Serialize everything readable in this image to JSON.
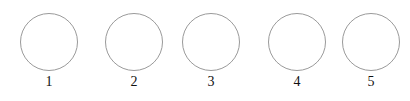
{
  "figure": {
    "background_color": "#ffffff",
    "width": 410,
    "height": 101
  },
  "style": {
    "circle_stroke_color": "#9a9a9a",
    "circle_stroke_width": 1,
    "circle_fill": "none",
    "circle_diameter": 58,
    "label_color": "#111111",
    "label_font_size": 14
  },
  "chart_data": {
    "type": "diagram",
    "title": "",
    "shape": "circle",
    "count": 5,
    "labels": [
      "1",
      "2",
      "3",
      "4",
      "5"
    ],
    "centers_x": [
      49,
      134,
      211,
      297,
      371
    ],
    "centers_y": [
      42,
      42,
      42,
      42,
      42
    ],
    "diameters": [
      58,
      58,
      58,
      58,
      58
    ]
  },
  "items": [
    {
      "label": "1",
      "cx": 49,
      "cy": 42,
      "d": 58,
      "label_y": 75
    },
    {
      "label": "2",
      "cx": 134,
      "cy": 42,
      "d": 58,
      "label_y": 75
    },
    {
      "label": "3",
      "cx": 211,
      "cy": 42,
      "d": 58,
      "label_y": 75
    },
    {
      "label": "4",
      "cx": 297,
      "cy": 42,
      "d": 58,
      "label_y": 75
    },
    {
      "label": "5",
      "cx": 371,
      "cy": 42,
      "d": 58,
      "label_y": 75
    }
  ]
}
